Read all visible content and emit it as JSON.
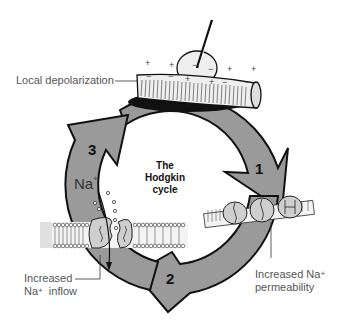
{
  "diagram": {
    "title_lines": [
      "The",
      "Hodgkin",
      "cycle"
    ],
    "steps": [
      {
        "number": "1",
        "label": "Increased Na+ permeability"
      },
      {
        "number": "2",
        "label": "Increased Na+ inflow"
      },
      {
        "number": "3",
        "label": "Local depolarization"
      }
    ],
    "labels": {
      "local_depolarization": "Local depolarization",
      "increased_1": "Increased Na",
      "increased_1_sup": "+",
      "permeability": "permeability",
      "increased_2": "Increased",
      "na_inflow": "Na",
      "na_inflow_sup": "+",
      "inflow": "inflow",
      "na_ion": "Na",
      "na_ion_sup": "+"
    },
    "step_numbers": {
      "one": "1",
      "two": "2",
      "three": "3"
    },
    "colors": {
      "arrow_fill": "#9a9a9a",
      "outline": "#111111",
      "membrane": "#e6e6e6",
      "label_text": "#555555"
    }
  }
}
